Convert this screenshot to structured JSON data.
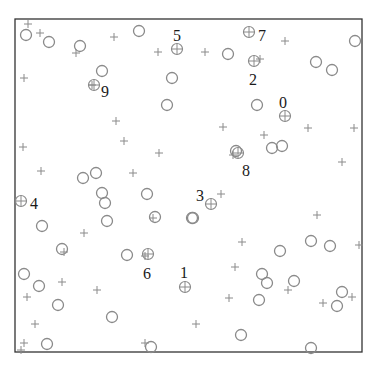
{
  "chart_data": {
    "type": "scatter",
    "title": "",
    "xlabel": "",
    "ylabel": "",
    "grid": false,
    "legend": null,
    "frame_px": {
      "left": 15,
      "top": 19,
      "right": 362,
      "bottom": 352
    },
    "coordinate_note": "points given in screen pixel coordinates (x right, y down)",
    "series": [
      {
        "name": "circles",
        "marker": "o",
        "color": "#8a8a8a",
        "points": [
          [
            26,
            35
          ],
          [
            49,
            42
          ],
          [
            80,
            46
          ],
          [
            139,
            31
          ],
          [
            102,
            71
          ],
          [
            172,
            78
          ],
          [
            167,
            105
          ],
          [
            228,
            54
          ],
          [
            316,
            62
          ],
          [
            332,
            70
          ],
          [
            355,
            41
          ],
          [
            257,
            105
          ],
          [
            236,
            151
          ],
          [
            272,
            148
          ],
          [
            282,
            146
          ],
          [
            96,
            173
          ],
          [
            83,
            178
          ],
          [
            102,
            193
          ],
          [
            105,
            203
          ],
          [
            107,
            221
          ],
          [
            147,
            194
          ],
          [
            155,
            217
          ],
          [
            192,
            218
          ],
          [
            42,
            226
          ],
          [
            62,
            249
          ],
          [
            127,
            255
          ],
          [
            24,
            274
          ],
          [
            39,
            286
          ],
          [
            58,
            305
          ],
          [
            112,
            317
          ],
          [
            151,
            347
          ],
          [
            47,
            344
          ],
          [
            193,
            218
          ],
          [
            280,
            251
          ],
          [
            311,
            241
          ],
          [
            330,
            246
          ],
          [
            262,
            274
          ],
          [
            267,
            283
          ],
          [
            294,
            281
          ],
          [
            259,
            300
          ],
          [
            342,
            292
          ],
          [
            337,
            306
          ],
          [
            241,
            335
          ],
          [
            311,
            348
          ]
        ]
      },
      {
        "name": "plus",
        "marker": "+",
        "color": "#8a8a8a",
        "points": [
          [
            28,
            24
          ],
          [
            40,
            33
          ],
          [
            76,
            53
          ],
          [
            114,
            37
          ],
          [
            24,
            78
          ],
          [
            92,
            85
          ],
          [
            158,
            52
          ],
          [
            205,
            52
          ],
          [
            285,
            41
          ],
          [
            260,
            59
          ],
          [
            116,
            121
          ],
          [
            124,
            141
          ],
          [
            159,
            153
          ],
          [
            23,
            147
          ],
          [
            41,
            171
          ],
          [
            133,
            173
          ],
          [
            223,
            127
          ],
          [
            264,
            135
          ],
          [
            308,
            128
          ],
          [
            354,
            128
          ],
          [
            233,
            155
          ],
          [
            342,
            162
          ],
          [
            84,
            233
          ],
          [
            64,
            252
          ],
          [
            153,
            218
          ],
          [
            221,
            194
          ],
          [
            317,
            215
          ],
          [
            242,
            242
          ],
          [
            359,
            245
          ],
          [
            62,
            282
          ],
          [
            97,
            290
          ],
          [
            27,
            297
          ],
          [
            145,
            256
          ],
          [
            235,
            267
          ],
          [
            288,
            290
          ],
          [
            229,
            298
          ],
          [
            323,
            303
          ],
          [
            352,
            297
          ],
          [
            35,
            324
          ],
          [
            196,
            324
          ],
          [
            145,
            343
          ],
          [
            24,
            343
          ],
          [
            21,
            350
          ]
        ]
      },
      {
        "name": "centroids",
        "marker": "circle-plus",
        "color": "#8a8a8a",
        "points": [
          {
            "label": "0",
            "x": 285,
            "y": 116,
            "label_x": 283,
            "label_y": 104
          },
          {
            "label": "1",
            "x": 185,
            "y": 287,
            "label_x": 184,
            "label_y": 274
          },
          {
            "label": "2",
            "x": 254,
            "y": 61,
            "label_x": 253,
            "label_y": 81
          },
          {
            "label": "3",
            "x": 211,
            "y": 204,
            "label_x": 200,
            "label_y": 197
          },
          {
            "label": "4",
            "x": 21,
            "y": 201,
            "label_x": 34,
            "label_y": 205
          },
          {
            "label": "5",
            "x": 177,
            "y": 49,
            "label_x": 177,
            "label_y": 37
          },
          {
            "label": "6",
            "x": 148,
            "y": 254,
            "label_x": 147,
            "label_y": 275
          },
          {
            "label": "7",
            "x": 249,
            "y": 32,
            "label_x": 262,
            "label_y": 37
          },
          {
            "label": "8",
            "x": 238,
            "y": 153,
            "label_x": 246,
            "label_y": 172
          },
          {
            "label": "9",
            "x": 94,
            "y": 85,
            "label_x": 105,
            "label_y": 93
          }
        ]
      }
    ]
  }
}
